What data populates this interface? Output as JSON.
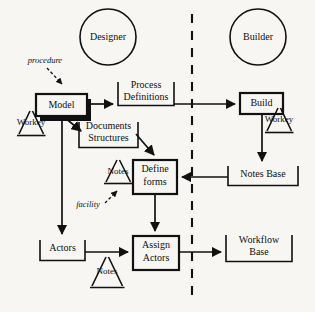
{
  "diagram": {
    "background_color": "#f7f6f3",
    "stroke_color": "#111111",
    "divider": {
      "name": "designer-builder-divider",
      "style": "dashed-vertical"
    },
    "roles": [
      {
        "id": "designer",
        "label": "Designer",
        "shape": "circle",
        "side": "left"
      },
      {
        "id": "builder",
        "label": "Builder",
        "shape": "circle",
        "side": "right"
      }
    ],
    "nodes": [
      {
        "id": "model",
        "label": "Model",
        "shape": "box-shadow",
        "lines": [
          "Model"
        ]
      },
      {
        "id": "process-definitions",
        "label": "Process Definitions",
        "shape": "open-top-box",
        "lines": [
          "Process",
          "Definitions"
        ]
      },
      {
        "id": "build",
        "label": "Build",
        "shape": "box",
        "lines": [
          "Build"
        ]
      },
      {
        "id": "documents-structures",
        "label": "Documents Structures",
        "shape": "open-top-box",
        "lines": [
          "Documents",
          "Structures"
        ]
      },
      {
        "id": "define-forms",
        "label": "Define forms",
        "shape": "box",
        "lines": [
          "Define",
          "forms"
        ]
      },
      {
        "id": "notes-base",
        "label": "Notes Base",
        "shape": "open-top-box",
        "lines": [
          "Notes Base"
        ]
      },
      {
        "id": "actors",
        "label": "Actors",
        "shape": "open-top-box",
        "lines": [
          "Actors"
        ]
      },
      {
        "id": "assign-actors",
        "label": "Assign Actors",
        "shape": "box",
        "lines": [
          "Assign",
          "Actors"
        ]
      },
      {
        "id": "workflow-base",
        "label": "Workflow Base",
        "shape": "open-top-box",
        "lines": [
          "Workflow",
          "Base"
        ]
      }
    ],
    "triangles": [
      {
        "id": "workey-left",
        "label": "Workey"
      },
      {
        "id": "workey-right",
        "label": "Workey"
      },
      {
        "id": "notes-forms",
        "label": "Notes"
      },
      {
        "id": "notes-actors",
        "label": "Notes"
      }
    ],
    "annotations": [
      {
        "id": "procedure",
        "label": "procedure",
        "style": "italic",
        "points_to": "model"
      },
      {
        "id": "facility",
        "label": "facility",
        "style": "italic",
        "points_to": "notes-forms"
      }
    ],
    "edges": [
      {
        "from": "model",
        "to": "process-definitions"
      },
      {
        "from": "process-definitions",
        "to": "build"
      },
      {
        "from": "model",
        "to": "documents-structures"
      },
      {
        "from": "model",
        "to": "actors"
      },
      {
        "from": "documents-structures",
        "to": "define-forms"
      },
      {
        "from": "build",
        "to": "notes-base"
      },
      {
        "from": "notes-base",
        "to": "define-forms"
      },
      {
        "from": "define-forms",
        "to": "assign-actors"
      },
      {
        "from": "actors",
        "to": "assign-actors"
      },
      {
        "from": "assign-actors",
        "to": "workflow-base"
      }
    ]
  }
}
